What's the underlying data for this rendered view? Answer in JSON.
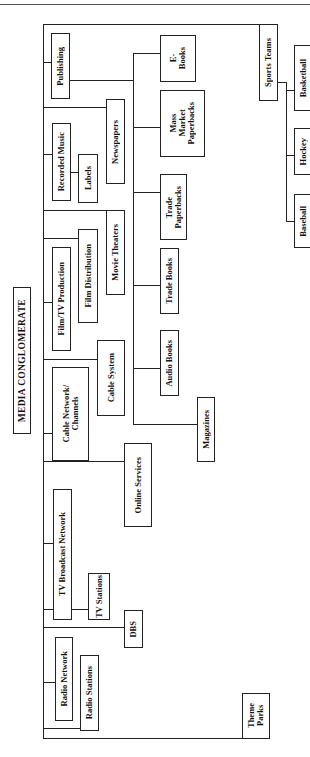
{
  "header": {
    "text": "Media Conglomerate Structure"
  },
  "chart": {
    "root": {
      "label": "MEDIA CONGLOMERATE"
    },
    "divisions": [
      {
        "label": "Publishing"
      },
      {
        "label": "Recorded Music"
      },
      {
        "label": "Film/TV Production"
      },
      {
        "label": "Cable Network/\nChannels"
      },
      {
        "label": "TV Broadcast Network"
      },
      {
        "label": "Radio Network"
      },
      {
        "label": "Sports Teams"
      },
      {
        "label": "Theme\nParks"
      }
    ],
    "units": {
      "labels": "Labels",
      "film_distribution": "Film Distribution",
      "radio_stations": "Radio Stations",
      "tv_stations": "TV Stations",
      "newspapers": "Newspapers",
      "movie_theaters": "Movie Theaters",
      "cable_system": "Cable System",
      "online_services": "Online Services",
      "dbs": "DBS",
      "magazines": "Magazines"
    },
    "books": [
      {
        "label": "E-\nBooks"
      },
      {
        "label": "Mass\nMarket\nPaperbacks"
      },
      {
        "label": "Trade\nPaperbacks"
      },
      {
        "label": "Trade Books"
      },
      {
        "label": "Audio Books"
      }
    ],
    "sports": [
      {
        "label": "Basketball"
      },
      {
        "label": "Hockey"
      },
      {
        "label": "Baseball"
      }
    ]
  }
}
